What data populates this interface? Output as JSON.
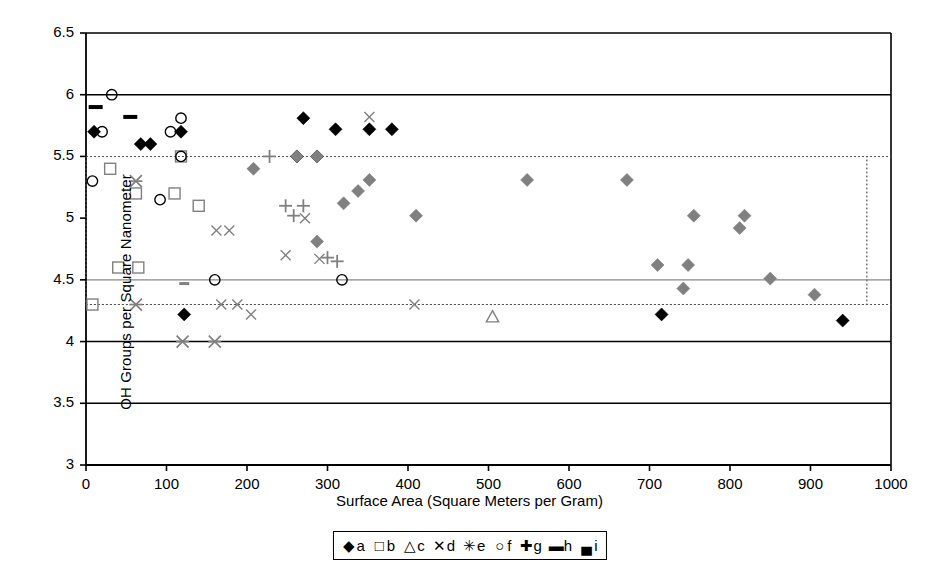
{
  "chart_data": {
    "type": "scatter",
    "title": "",
    "xlabel": "Surface Area (Square Meters per Gram)",
    "ylabel": "OH Groups per Square Nanometer",
    "xlim": [
      0,
      1000
    ],
    "ylim": [
      3,
      6.5
    ],
    "xticks": [
      "0",
      "100",
      "200",
      "300",
      "400",
      "500",
      "600",
      "700",
      "800",
      "900",
      "1000"
    ],
    "yticks": [
      "3",
      "3.5",
      "4",
      "4.5",
      "5",
      "5.5",
      "6",
      "6.5"
    ],
    "grid": "horizontal",
    "gridlines_solid": [
      6,
      4,
      3.5
    ],
    "gridlines_light": [
      4.5
    ],
    "gridlines_dotted": [
      5.5,
      4.3
    ],
    "reference_box": {
      "x0": 0,
      "x1": 970,
      "y0": 4.3,
      "y1": 5.5,
      "style": "dotted"
    },
    "legend_position": "below-axis-center",
    "series": [
      {
        "name": "a",
        "marker": "filled-diamond",
        "color": "#000000",
        "points": [
          [
            10,
            5.7
          ],
          [
            68,
            5.6
          ],
          [
            80,
            5.6
          ],
          [
            118,
            5.7
          ],
          [
            270,
            5.81
          ],
          [
            310,
            5.72
          ],
          [
            352,
            5.72
          ],
          [
            380,
            5.72
          ],
          [
            262,
            5.5
          ],
          [
            287,
            5.5
          ],
          [
            122,
            4.22
          ],
          [
            715,
            4.22
          ],
          [
            940,
            4.17
          ]
        ]
      },
      {
        "name": "b",
        "marker": "open-square",
        "color": "#808080",
        "points": [
          [
            30,
            5.4
          ],
          [
            62,
            5.2
          ],
          [
            110,
            5.2
          ],
          [
            140,
            5.1
          ],
          [
            40,
            4.6
          ],
          [
            65,
            4.6
          ],
          [
            8,
            4.3
          ],
          [
            118,
            5.5
          ]
        ]
      },
      {
        "name": "c",
        "marker": "open-triangle",
        "color": "#808080",
        "points": [
          [
            505,
            4.2
          ]
        ]
      },
      {
        "name": "d",
        "marker": "x-cross",
        "color": "#808080",
        "points": [
          [
            162,
            4.9
          ],
          [
            178,
            4.9
          ],
          [
            248,
            4.7
          ],
          [
            290,
            4.67
          ],
          [
            272,
            5.0
          ],
          [
            168,
            4.3
          ],
          [
            188,
            4.3
          ],
          [
            205,
            4.22
          ],
          [
            408,
            4.3
          ],
          [
            352,
            5.82
          ]
        ]
      },
      {
        "name": "e",
        "marker": "asterisk",
        "color": "#808080",
        "points": [
          [
            62,
            5.3
          ],
          [
            62,
            4.3
          ],
          [
            120,
            4.0
          ],
          [
            160,
            4.0
          ]
        ]
      },
      {
        "name": "f",
        "marker": "open-circle",
        "color": "#000000",
        "points": [
          [
            32,
            6.0
          ],
          [
            20,
            5.7
          ],
          [
            105,
            5.7
          ],
          [
            118,
            5.81
          ],
          [
            8,
            5.3
          ],
          [
            92,
            5.15
          ],
          [
            118,
            5.5
          ],
          [
            160,
            4.5
          ],
          [
            318,
            4.5
          ]
        ]
      },
      {
        "name": "g",
        "marker": "plus",
        "color": "#808080",
        "points": [
          [
            248,
            5.1
          ],
          [
            270,
            5.1
          ],
          [
            258,
            5.02
          ],
          [
            228,
            5.5
          ],
          [
            300,
            4.68
          ],
          [
            312,
            4.65
          ]
        ]
      },
      {
        "name": "h",
        "marker": "dash-long",
        "color": "#000000",
        "points": [
          [
            12,
            5.9
          ],
          [
            55,
            5.82
          ]
        ]
      },
      {
        "name": "i",
        "marker": "dash-short",
        "color": "#808080",
        "points": [
          [
            122,
            4.47
          ]
        ]
      },
      {
        "name": "gray-diamond",
        "marker": "filled-diamond-gray",
        "color": "#808080",
        "points": [
          [
            208,
            5.4
          ],
          [
            320,
            5.12
          ],
          [
            338,
            5.22
          ],
          [
            352,
            5.31
          ],
          [
            410,
            5.02
          ],
          [
            548,
            5.31
          ],
          [
            672,
            5.31
          ],
          [
            710,
            4.62
          ],
          [
            748,
            4.62
          ],
          [
            755,
            5.02
          ],
          [
            742,
            4.43
          ],
          [
            812,
            4.92
          ],
          [
            818,
            5.02
          ],
          [
            850,
            4.51
          ],
          [
            905,
            4.38
          ],
          [
            287,
            4.81
          ],
          [
            262,
            5.5
          ],
          [
            287,
            5.5
          ]
        ]
      }
    ]
  },
  "legend": {
    "entries": [
      {
        "symbol": "◆",
        "label": "a"
      },
      {
        "symbol": "□",
        "label": "b"
      },
      {
        "symbol": "△",
        "label": "c"
      },
      {
        "symbol": "✕",
        "label": "d"
      },
      {
        "symbol": "✳",
        "label": "e"
      },
      {
        "symbol": "○",
        "label": "f"
      },
      {
        "symbol": "✚",
        "label": "g"
      },
      {
        "symbol": "▬",
        "label": "h"
      },
      {
        "symbol": "▄",
        "label": "i"
      }
    ]
  },
  "axes": {
    "y_title": "OH Groups per Square Nanometer",
    "x_title": "Surface Area (Square Meters per Gram)"
  }
}
